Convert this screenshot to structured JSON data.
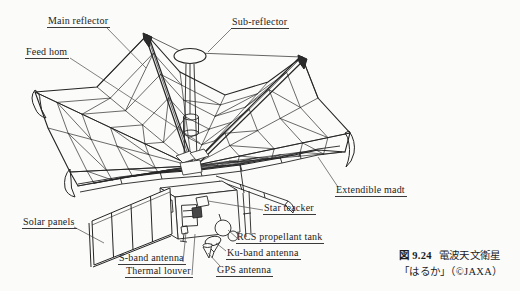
{
  "figure": {
    "labels": {
      "main_reflector": "Main reflector",
      "sub_reflector": "Sub-reflector",
      "feed_horn": "Feed hom",
      "solar_panels": "Solar panels",
      "s_band_antenna": "S-band antenna",
      "thermal_louver": "Thermal louver",
      "gps_antenna": "GPS antenna",
      "ku_band_antenna": "Ku-band antenna",
      "rcs_propellant_tank": "RCS propellant tank",
      "star_tracker": "Star teacker",
      "extendible_mast": "Extendible madt"
    },
    "caption": {
      "figure_number": "図 9.24",
      "title": "電波天文衛星",
      "title_line2": "「はるか」（©JAXA）"
    },
    "colors": {
      "line": "#2b2b2b",
      "leader": "#4a4a4a",
      "background": "#fbfbfa",
      "text": "#232323"
    }
  }
}
